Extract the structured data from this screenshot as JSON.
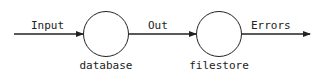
{
  "diagram": {
    "type": "data-flow",
    "nodes": [
      {
        "id": "database",
        "label": "database"
      },
      {
        "id": "filestore",
        "label": "filestore"
      }
    ],
    "edges": [
      {
        "from": null,
        "to": "database",
        "label": "Input"
      },
      {
        "from": "database",
        "to": "filestore",
        "label": "Out"
      },
      {
        "from": "filestore",
        "to": null,
        "label": "Errors"
      }
    ]
  },
  "colors": {
    "stroke": "#222222",
    "background": "#ffffff"
  }
}
